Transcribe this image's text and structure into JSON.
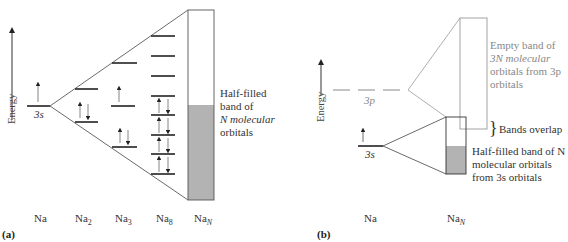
{
  "panel_a": {
    "label": "(a)",
    "energy_label": "Energy",
    "atom_level_label": "3s",
    "band_caption": [
      "Half-filled",
      "band of",
      "N molecular",
      "orbitals"
    ],
    "columns": [
      "Na",
      "Na",
      "Na",
      "Na",
      "Na"
    ],
    "column_subscripts": [
      "",
      "2",
      "3",
      "8",
      "N"
    ]
  },
  "panel_b": {
    "label": "(b)",
    "energy_label": "Energy",
    "level_3p_label": "3p",
    "level_3s_label": "3s",
    "empty_band_caption": [
      "Empty band of",
      "3N molecular",
      "orbitals from 3p",
      "orbitals"
    ],
    "overlap_caption": "Bands overlap",
    "half_band_caption": [
      "Half-filled band of N",
      "molecular orbitals",
      "from 3s orbitals"
    ],
    "columns": [
      "Na",
      "Na"
    ],
    "column_subscripts": [
      "",
      "N"
    ]
  },
  "colors": {
    "line": "#333333",
    "gray_line": "#999999",
    "fill": "#b3b3b3"
  }
}
